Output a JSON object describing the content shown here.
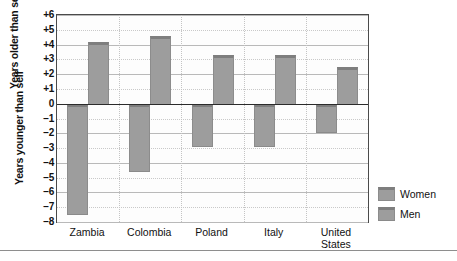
{
  "chart_data": {
    "type": "bar",
    "title": "",
    "subtitle": "",
    "xlabel": "",
    "ylabel": "",
    "ylabel_positive": "Years older than self",
    "ylabel_negative": "Years younger than self",
    "categories": [
      "Zambia",
      "Colombia",
      "Poland",
      "Italy",
      "United States"
    ],
    "series": [
      {
        "name": "Women",
        "values": [
          -7.5,
          -4.6,
          -2.9,
          -2.9,
          -2.0
        ]
      },
      {
        "name": "Men",
        "values": [
          4.2,
          4.6,
          3.3,
          3.3,
          2.5
        ]
      }
    ],
    "ylim": [
      -8,
      6
    ],
    "ytick_values": [
      6,
      5,
      4,
      3,
      2,
      1,
      0,
      -1,
      -2,
      -3,
      -4,
      -5,
      -6,
      -7,
      -8
    ],
    "ytick_labels": [
      "+6",
      "+5",
      "+4",
      "+3",
      "+2",
      "+1",
      "0",
      "−1",
      "−2",
      "−3",
      "−4",
      "−5",
      "−6",
      "−7",
      "−8"
    ],
    "grid": true,
    "zero_line": true,
    "legend_position": "right-bottom",
    "legend_entries": [
      "Women",
      "Men"
    ],
    "bar_color": "#9d9d9d",
    "bar_edge_color": "#7e7e7e",
    "axis_color": "#4a4a4a",
    "grid_color": "#b9b9b9"
  },
  "legend": {
    "items": [
      {
        "label": "Women",
        "color": "#9d9d9d"
      },
      {
        "label": "Men",
        "color": "#9d9d9d"
      }
    ]
  }
}
